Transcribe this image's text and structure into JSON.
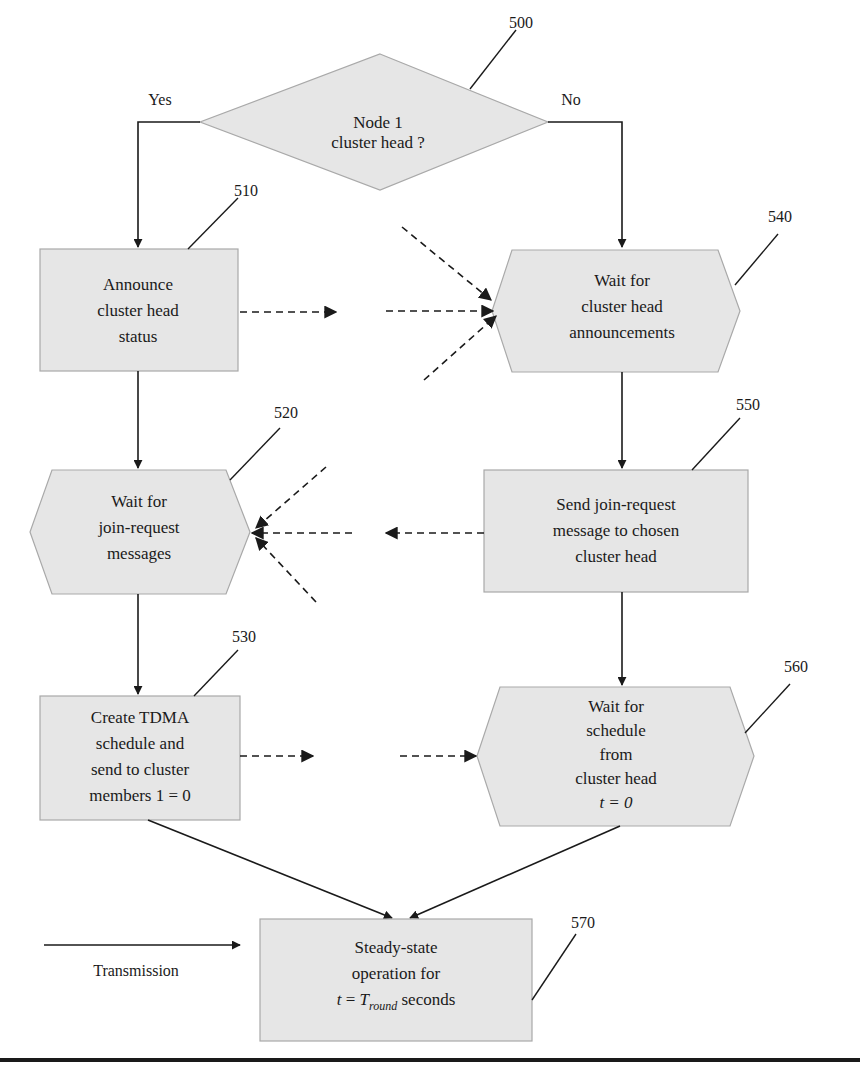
{
  "colors": {
    "node_fill": "#e6e6e6",
    "node_border": "#a9a9a9",
    "line": "#1a1a1a",
    "background": "#ffffff"
  },
  "decision": {
    "ref": "500",
    "lines": [
      "Node 1",
      "cluster head ?"
    ],
    "yes_label": "Yes",
    "no_label": "No"
  },
  "nodes": [
    {
      "ref": "510",
      "shape": "rectangle",
      "lines": [
        "Announce",
        "cluster head",
        "status"
      ]
    },
    {
      "ref": "520",
      "shape": "hexagon",
      "lines": [
        "Wait for",
        "join-request",
        "messages"
      ]
    },
    {
      "ref": "530",
      "shape": "rectangle",
      "lines": [
        "Create TDMA",
        "schedule and",
        "send to cluster",
        "members 1 = 0"
      ]
    },
    {
      "ref": "540",
      "shape": "hexagon",
      "lines": [
        "Wait for",
        "cluster head",
        "announcements"
      ]
    },
    {
      "ref": "550",
      "shape": "rectangle",
      "lines": [
        "Send join-request",
        "message to chosen",
        "cluster head"
      ]
    },
    {
      "ref": "560",
      "shape": "hexagon",
      "lines": [
        "Wait for",
        "schedule",
        "from",
        "cluster head",
        "t = 0"
      ]
    },
    {
      "ref": "570",
      "shape": "rectangle",
      "lines": [
        "Steady-state",
        "operation for"
      ],
      "formula": {
        "lhs": "t",
        "eq": " = ",
        "var": "T",
        "sub": "round",
        "suffix": " seconds"
      }
    }
  ],
  "legend": {
    "label": "Transmission"
  }
}
